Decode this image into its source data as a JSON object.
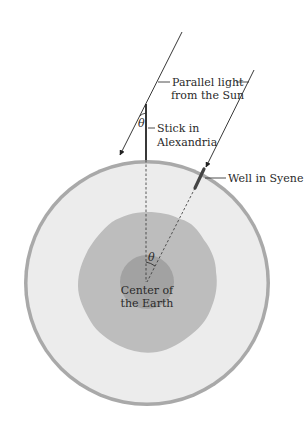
{
  "diagram": {
    "labels": {
      "sunlight_line1": "Parallel light",
      "sunlight_line2": "from the Sun",
      "stick_line1": "Stick in",
      "stick_line2": "Alexandria",
      "well": "Well in Syene",
      "center_line1": "Center of",
      "center_line2": "the Earth",
      "angle_at_stick": "θ",
      "angle_at_center": "θ"
    },
    "colors": {
      "background": "#ffffff",
      "earth_outer_ring": "#a9a9a9",
      "earth_surface": "#ececec",
      "mantle": "#bdbdbd",
      "core": "#a2a2a2",
      "lines": "#222222",
      "well": "#444444"
    }
  }
}
